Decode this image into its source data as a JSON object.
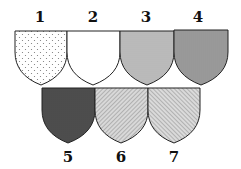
{
  "shields": [
    {
      "label": "1",
      "pattern": "dots",
      "row": 1
    },
    {
      "label": "2",
      "pattern": "plain",
      "row": 1
    },
    {
      "label": "3",
      "pattern": "horizontal-lines",
      "row": 1
    },
    {
      "label": "4",
      "pattern": "vertical-lines",
      "row": 1
    },
    {
      "label": "5",
      "pattern": "crosshatch",
      "row": 2
    },
    {
      "label": "6",
      "pattern": "diagonal-dexter",
      "row": 2
    },
    {
      "label": "7",
      "pattern": "diagonal-sinister",
      "row": 2
    }
  ],
  "colors": {
    "ink": "#222222",
    "background": "#ffffff"
  }
}
